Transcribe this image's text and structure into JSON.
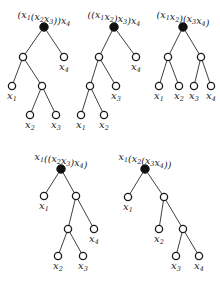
{
  "figure": {
    "colors": {
      "root": "#111111",
      "node_stroke": "#1a1a1a",
      "edge": "#2a2a2a"
    },
    "trees": [
      {
        "id": "t1",
        "title": "(x_1(x_2x_3))x_4",
        "nodes": [
          {
            "id": "r",
            "type": "root",
            "x": 44,
            "y": 27
          },
          {
            "id": "a",
            "type": "inner",
            "x": 23,
            "y": 57
          },
          {
            "id": "x4",
            "type": "leaf",
            "x": 64,
            "y": 57,
            "label": "x_4"
          },
          {
            "id": "x1",
            "type": "leaf",
            "x": 12,
            "y": 86,
            "label": "x_1"
          },
          {
            "id": "b",
            "type": "inner",
            "x": 42,
            "y": 86
          },
          {
            "id": "x2",
            "type": "leaf",
            "x": 30,
            "y": 115,
            "label": "x_2"
          },
          {
            "id": "x3",
            "type": "leaf",
            "x": 56,
            "y": 115,
            "label": "x_3"
          }
        ],
        "edges": [
          [
            "r",
            "a"
          ],
          [
            "r",
            "x4"
          ],
          [
            "a",
            "x1"
          ],
          [
            "a",
            "b"
          ],
          [
            "b",
            "x2"
          ],
          [
            "b",
            "x3"
          ]
        ]
      },
      {
        "id": "t2",
        "title": "((x_1x_2)x_3)x_4",
        "nodes": [
          {
            "id": "r",
            "type": "root",
            "x": 114,
            "y": 27
          },
          {
            "id": "a",
            "type": "inner",
            "x": 99,
            "y": 57
          },
          {
            "id": "x4",
            "type": "leaf",
            "x": 136,
            "y": 57,
            "label": "x_4"
          },
          {
            "id": "b",
            "type": "inner",
            "x": 90,
            "y": 86
          },
          {
            "id": "x3",
            "type": "leaf",
            "x": 116,
            "y": 86,
            "label": "x_3"
          },
          {
            "id": "x1",
            "type": "leaf",
            "x": 81,
            "y": 115,
            "label": "x_1"
          },
          {
            "id": "x2",
            "type": "leaf",
            "x": 104,
            "y": 115,
            "label": "x_2"
          }
        ],
        "edges": [
          [
            "r",
            "a"
          ],
          [
            "r",
            "x4"
          ],
          [
            "a",
            "b"
          ],
          [
            "a",
            "x3"
          ],
          [
            "b",
            "x1"
          ],
          [
            "b",
            "x2"
          ]
        ]
      },
      {
        "id": "t3",
        "title": "(x_1x_2)(x_3x_4)",
        "nodes": [
          {
            "id": "r",
            "type": "root",
            "x": 183,
            "y": 27
          },
          {
            "id": "a",
            "type": "inner",
            "x": 168,
            "y": 57
          },
          {
            "id": "b",
            "type": "inner",
            "x": 201,
            "y": 57
          },
          {
            "id": "x1",
            "type": "leaf",
            "x": 159,
            "y": 86,
            "label": "x_1"
          },
          {
            "id": "x2",
            "type": "leaf",
            "x": 179,
            "y": 86,
            "label": "x_2"
          },
          {
            "id": "x3",
            "type": "leaf",
            "x": 194,
            "y": 86,
            "label": "x_3"
          },
          {
            "id": "x4",
            "type": "leaf",
            "x": 211,
            "y": 86,
            "label": "x_4"
          }
        ],
        "edges": [
          [
            "r",
            "a"
          ],
          [
            "r",
            "b"
          ],
          [
            "a",
            "x1"
          ],
          [
            "a",
            "x2"
          ],
          [
            "b",
            "x3"
          ],
          [
            "b",
            "x4"
          ]
        ]
      },
      {
        "id": "t4",
        "title": "x_1((x_2x_3)x_4)",
        "nodes": [
          {
            "id": "r",
            "type": "root",
            "x": 61,
            "y": 169
          },
          {
            "id": "x1",
            "type": "leaf",
            "x": 44,
            "y": 196,
            "label": "x_1"
          },
          {
            "id": "a",
            "type": "inner",
            "x": 76,
            "y": 196
          },
          {
            "id": "b",
            "type": "inner",
            "x": 68,
            "y": 229
          },
          {
            "id": "x4",
            "type": "leaf",
            "x": 94,
            "y": 229,
            "label": "x_4"
          },
          {
            "id": "x2",
            "type": "leaf",
            "x": 58,
            "y": 256,
            "label": "x_2"
          },
          {
            "id": "x3",
            "type": "leaf",
            "x": 83,
            "y": 256,
            "label": "x_3"
          }
        ],
        "edges": [
          [
            "r",
            "x1"
          ],
          [
            "r",
            "a"
          ],
          [
            "a",
            "b"
          ],
          [
            "a",
            "x4"
          ],
          [
            "b",
            "x2"
          ],
          [
            "b",
            "x3"
          ]
        ]
      },
      {
        "id": "t5",
        "title": "x_1(x_2(x_3x_4))",
        "nodes": [
          {
            "id": "r",
            "type": "root",
            "x": 145,
            "y": 169
          },
          {
            "id": "x1",
            "type": "leaf",
            "x": 128,
            "y": 197,
            "label": "x_1"
          },
          {
            "id": "a",
            "type": "inner",
            "x": 164,
            "y": 197
          },
          {
            "id": "x2",
            "type": "leaf",
            "x": 159,
            "y": 229,
            "label": "x_2"
          },
          {
            "id": "b",
            "type": "inner",
            "x": 183,
            "y": 229
          },
          {
            "id": "x3",
            "type": "leaf",
            "x": 176,
            "y": 256,
            "label": "x_3"
          },
          {
            "id": "x4",
            "type": "leaf",
            "x": 199,
            "y": 256,
            "label": "x_4"
          }
        ],
        "edges": [
          [
            "r",
            "x1"
          ],
          [
            "r",
            "a"
          ],
          [
            "a",
            "x2"
          ],
          [
            "a",
            "b"
          ],
          [
            "b",
            "x3"
          ],
          [
            "b",
            "x4"
          ]
        ]
      }
    ]
  }
}
